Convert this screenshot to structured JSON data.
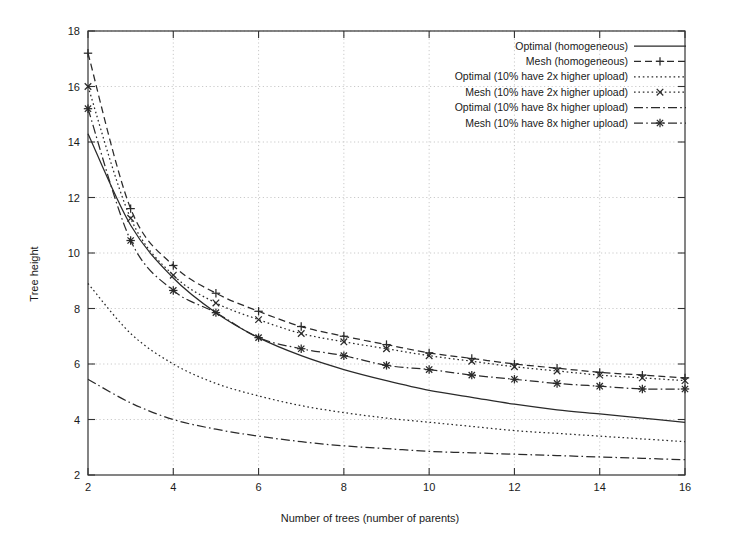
{
  "chart_data": {
    "type": "line",
    "title": "",
    "xlabel": "Number of trees (number of parents)",
    "ylabel": "Tree height",
    "xlim": [
      2,
      16
    ],
    "ylim": [
      2,
      18
    ],
    "xticks": [
      2,
      4,
      6,
      8,
      10,
      12,
      14,
      16
    ],
    "yticks": [
      2,
      4,
      6,
      8,
      10,
      12,
      14,
      16,
      18
    ],
    "grid": true,
    "legend_position": "top-right",
    "x": [
      2,
      3,
      4,
      5,
      6,
      7,
      8,
      9,
      10,
      11,
      12,
      13,
      14,
      15,
      16
    ],
    "series": [
      {
        "name": "Optimal (homogeneous)",
        "style": "solid",
        "marker": "none",
        "color": "#2a2a2a",
        "values": [
          14.3,
          11.0,
          9.1,
          7.85,
          6.95,
          6.3,
          5.8,
          5.4,
          5.05,
          4.8,
          4.55,
          4.35,
          4.2,
          4.05,
          3.9
        ]
      },
      {
        "name": "Mesh (homogeneous)",
        "style": "dashed",
        "marker": "plus",
        "color": "#2a2a2a",
        "values": [
          17.2,
          11.6,
          9.55,
          8.55,
          7.9,
          7.35,
          7.0,
          6.7,
          6.4,
          6.2,
          6.0,
          5.85,
          5.7,
          5.6,
          5.5
        ]
      },
      {
        "name": "Optimal (10% have 2x higher upload)",
        "style": "dotted",
        "marker": "none",
        "color": "#2a2a2a",
        "values": [
          8.9,
          7.1,
          6.0,
          5.3,
          4.85,
          4.5,
          4.25,
          4.05,
          3.9,
          3.75,
          3.6,
          3.5,
          3.4,
          3.3,
          3.2
        ]
      },
      {
        "name": "Mesh (10% have 2x higher upload)",
        "style": "dotted",
        "marker": "cross",
        "color": "#2a2a2a",
        "values": [
          16.0,
          11.25,
          9.2,
          8.2,
          7.6,
          7.1,
          6.8,
          6.55,
          6.3,
          6.1,
          5.9,
          5.75,
          5.6,
          5.5,
          5.4
        ]
      },
      {
        "name": "Optimal (10% have 8x higher upload)",
        "style": "dashdot",
        "marker": "none",
        "color": "#2a2a2a",
        "values": [
          5.45,
          4.6,
          4.0,
          3.65,
          3.4,
          3.2,
          3.05,
          2.95,
          2.85,
          2.8,
          2.75,
          2.7,
          2.65,
          2.6,
          2.55
        ]
      },
      {
        "name": "Mesh (10% have 8x higher upload)",
        "style": "dashdot",
        "marker": "asterisk",
        "color": "#2a2a2a",
        "values": [
          15.2,
          10.45,
          8.65,
          7.85,
          6.95,
          6.55,
          6.3,
          5.95,
          5.8,
          5.6,
          5.45,
          5.3,
          5.2,
          5.1,
          5.1
        ]
      }
    ]
  }
}
